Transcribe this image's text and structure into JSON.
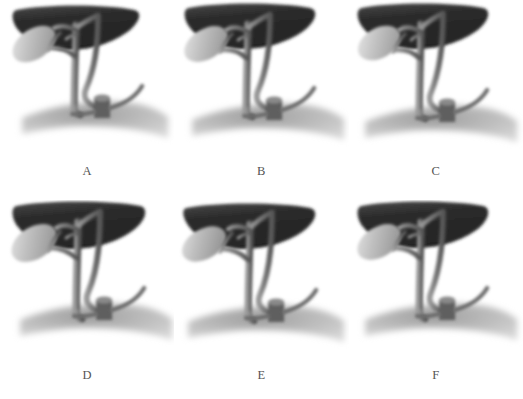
{
  "figure": {
    "type": "anatomical-illustration-grid",
    "rows": 2,
    "columns": 3,
    "background_color": "#ffffff",
    "ink_color": "#6f6f6f",
    "label_color": "#545454",
    "liver_dark_color": "#2b2b2b",
    "liver_light_color": "#bdbdbd",
    "gallbladder_color": "#b4b4b4",
    "duct_color": "#7d7d7d",
    "duct_shadow_color": "#4a4a4a",
    "duodenum_color": "#8c8c8c"
  },
  "panels": [
    {
      "id": "panel-a",
      "label": "A",
      "structures": {
        "liver": "liver",
        "gallbladder": "gallbladder",
        "cystic_duct": "cystic-duct",
        "common_hepatic_duct": "common-hepatic-duct",
        "common_bile_duct": "common-bile-duct",
        "pancreatic_duct": "pancreatic-duct",
        "duodenum": "duodenum",
        "papilla": "duodenal-papilla"
      }
    },
    {
      "id": "panel-b",
      "label": "B",
      "structures": {
        "liver": "liver",
        "gallbladder": "gallbladder",
        "cystic_duct": "cystic-duct",
        "common_hepatic_duct": "common-hepatic-duct",
        "common_bile_duct": "common-bile-duct",
        "pancreatic_duct": "pancreatic-duct",
        "duodenum": "duodenum",
        "papilla": "duodenal-papilla"
      }
    },
    {
      "id": "panel-c",
      "label": "C",
      "structures": {
        "liver": "liver",
        "gallbladder": "gallbladder",
        "cystic_duct": "cystic-duct",
        "common_hepatic_duct": "common-hepatic-duct",
        "common_bile_duct": "common-bile-duct",
        "pancreatic_duct": "pancreatic-duct",
        "duodenum": "duodenum",
        "papilla": "duodenal-papilla"
      }
    },
    {
      "id": "panel-d",
      "label": "D",
      "structures": {
        "liver": "liver",
        "gallbladder": "gallbladder",
        "cystic_duct": "cystic-duct",
        "common_hepatic_duct": "common-hepatic-duct",
        "common_bile_duct": "common-bile-duct",
        "pancreatic_duct": "pancreatic-duct",
        "duodenum": "duodenum",
        "papilla": "duodenal-papilla"
      }
    },
    {
      "id": "panel-e",
      "label": "E",
      "structures": {
        "liver": "liver",
        "gallbladder": "gallbladder",
        "cystic_duct": "cystic-duct",
        "common_hepatic_duct": "common-hepatic-duct",
        "common_bile_duct": "common-bile-duct",
        "pancreatic_duct": "pancreatic-duct",
        "duodenum": "duodenum",
        "papilla": "duodenal-papilla"
      }
    },
    {
      "id": "panel-f",
      "label": "F",
      "structures": {
        "liver": "liver",
        "gallbladder": "gallbladder",
        "cystic_duct": "cystic-duct",
        "common_hepatic_duct": "common-hepatic-duct",
        "common_bile_duct": "common-bile-duct",
        "pancreatic_duct": "pancreatic-duct",
        "duodenum": "duodenum",
        "papilla": "duodenal-papilla"
      }
    }
  ]
}
